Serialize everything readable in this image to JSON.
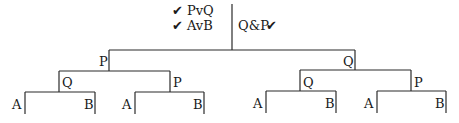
{
  "root": {
    "left_labels": [
      {
        "check": "✔",
        "text": "PvQ"
      },
      {
        "check": "✔",
        "text": "AvB"
      }
    ],
    "right_label": {
      "text": "Q&P",
      "check": "✔"
    }
  },
  "tree": {
    "left_node": {
      "label": "P",
      "children": [
        {
          "label": "Q",
          "leaves": [
            "A",
            "B"
          ]
        },
        {
          "label": "P",
          "leaves": [
            "A",
            "B"
          ]
        }
      ]
    },
    "right_node": {
      "label": "Q",
      "children": [
        {
          "label": "Q",
          "leaves": [
            "A",
            "B"
          ]
        },
        {
          "label": "P",
          "leaves": [
            "A",
            "B"
          ]
        }
      ]
    }
  }
}
